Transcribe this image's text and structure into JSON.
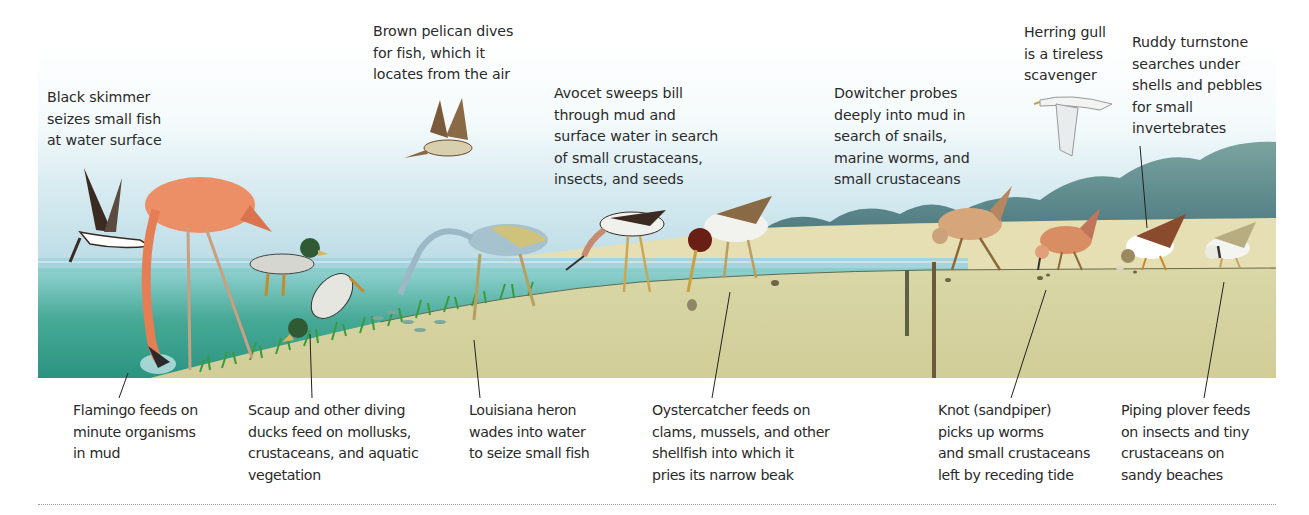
{
  "figure": {
    "colors": {
      "sky_top": "#ffffff",
      "sky_bottom": "#b9dbe6",
      "water_surface": "#a9d3de",
      "water_deep": "#2f9a86",
      "mud": "#d7d4a4",
      "dry_sand": "#e6e0b8",
      "hills": "#5f8a90",
      "vegetation": "#3f9a3c",
      "leader_line": "#222222",
      "rule": "#9a9a9a"
    },
    "top_captions": [
      {
        "id": "black-skimmer",
        "text": "Black skimmer\nseizes small fish\nat water surface"
      },
      {
        "id": "brown-pelican",
        "text": "Brown pelican dives\nfor fish, which it\nlocates from the air"
      },
      {
        "id": "avocet",
        "text": "Avocet sweeps bill\nthrough mud and\nsurface water in search\nof small crustaceans,\ninsects, and seeds"
      },
      {
        "id": "dowitcher",
        "text": "Dowitcher probes\ndeeply into mud in\nsearch of snails,\nmarine worms, and\nsmall crustaceans"
      },
      {
        "id": "herring-gull",
        "text": "Herring gull\nis a tireless\nscavenger"
      },
      {
        "id": "ruddy-turnstone",
        "text": "Ruddy turnstone\nsearches under\nshells and pebbles\nfor small\ninvertebrates"
      }
    ],
    "bottom_captions": [
      {
        "id": "flamingo",
        "text": "Flamingo feeds on\nminute organisms\nin mud"
      },
      {
        "id": "scaup",
        "text": "Scaup and other diving\nducks feed on mollusks,\ncrustaceans, and aquatic\nvegetation"
      },
      {
        "id": "louisiana-heron",
        "text": "Louisiana heron\nwades into water\nto seize small fish"
      },
      {
        "id": "oystercatcher",
        "text": "Oystercatcher feeds on\nclams, mussels, and other\nshellfish into which it\npries its narrow beak"
      },
      {
        "id": "knot",
        "text": "Knot (sandpiper)\npicks up worms\nand small crustaceans\nleft by receding tide"
      },
      {
        "id": "piping-plover",
        "text": "Piping plover feeds\non insects and tiny\ncrustaceans on\nsandy beaches"
      }
    ],
    "birds": [
      {
        "name": "Black skimmer",
        "pose": "flying low over water"
      },
      {
        "name": "Flamingo",
        "pose": "wading, head in mud"
      },
      {
        "name": "Scaup",
        "pose": "swimming and diving"
      },
      {
        "name": "Brown pelican",
        "pose": "flying"
      },
      {
        "name": "Louisiana heron",
        "pose": "wading, striking fish"
      },
      {
        "name": "Avocet",
        "pose": "sweeping bill"
      },
      {
        "name": "Oystercatcher",
        "pose": "probing shellfish"
      },
      {
        "name": "Dowitcher",
        "pose": "probing deep mud"
      },
      {
        "name": "Knot",
        "pose": "picking at surface"
      },
      {
        "name": "Herring gull",
        "pose": "flying"
      },
      {
        "name": "Ruddy turnstone",
        "pose": "flipping pebbles"
      },
      {
        "name": "Piping plover",
        "pose": "feeding on sand"
      }
    ]
  }
}
